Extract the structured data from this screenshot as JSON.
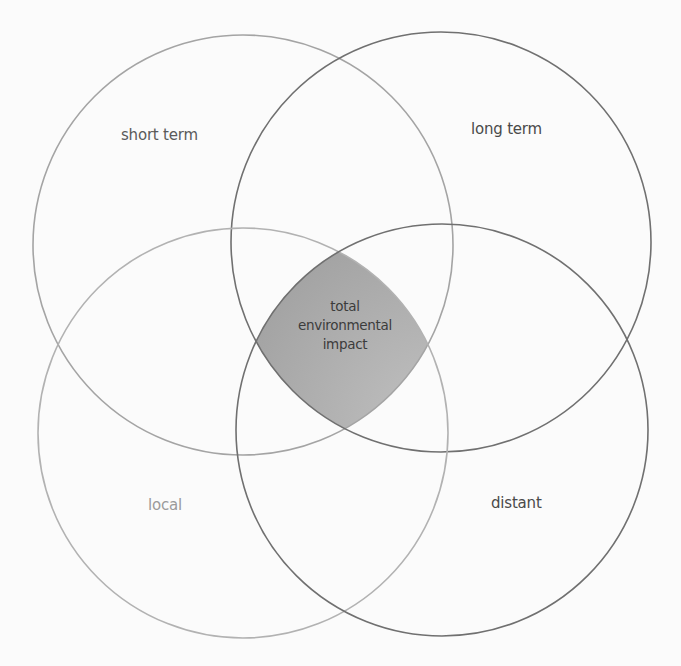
{
  "diagram": {
    "type": "venn",
    "sets": [
      {
        "id": "short_term",
        "label": "short term",
        "position": "top-left",
        "stroke": "#a0a0a0"
      },
      {
        "id": "long_term",
        "label": "long term",
        "position": "top-right",
        "stroke": "#6e6e6e"
      },
      {
        "id": "local",
        "label": "local",
        "position": "bottom-left",
        "stroke": "#b4b4b4"
      },
      {
        "id": "distant",
        "label": "distant",
        "position": "bottom-right",
        "stroke": "#6e6e6e"
      }
    ],
    "intersection": {
      "sets": [
        "short_term",
        "long_term",
        "local",
        "distant"
      ],
      "lines": [
        "total",
        "environmental",
        "impact"
      ],
      "fill": "#a8a8a8"
    }
  },
  "colors": {
    "background": "#fbfbfb",
    "intersection_fill": "#a8a8a8",
    "intersection_stroke": "#6a6a6a"
  }
}
